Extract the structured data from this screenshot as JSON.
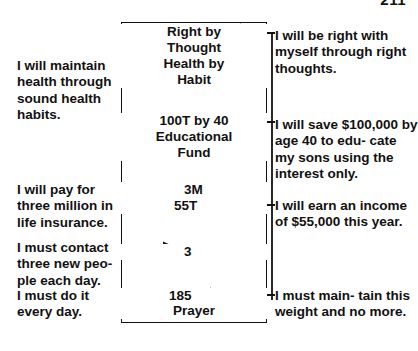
{
  "page": {
    "folio": "211"
  },
  "goal_box": {
    "items": [
      {
        "id": "right-by-thought",
        "lines": [
          "Right by",
          "Thought"
        ]
      },
      {
        "id": "health-by-habit",
        "lines": [
          "Health by",
          "Habit"
        ]
      },
      {
        "id": "educational-fund",
        "lines": [
          "100T by 40",
          "Educational",
          "Fund"
        ]
      },
      {
        "id": "three-million",
        "lines": [
          "3M"
        ]
      },
      {
        "id": "fifty-five-thousand",
        "lines": [
          "55T"
        ]
      },
      {
        "id": "three-people",
        "lines": [
          "3"
        ]
      },
      {
        "id": "one-eighty-five",
        "lines": [
          "185"
        ]
      },
      {
        "id": "prayer",
        "lines": [
          "Prayer"
        ]
      }
    ],
    "text": {
      "right_by": "Right by",
      "thought": "Thought",
      "health_by": "Health by",
      "habit": "Habit",
      "hundred_t_by_40": "100T by 40",
      "educational": "Educational",
      "fund": "Fund",
      "three_m": "3M",
      "fifty_five_t": "55T",
      "three": "3",
      "one_eight_five": "185",
      "prayer": "Prayer"
    }
  },
  "annotations": {
    "left": [
      {
        "id": "maintain-health",
        "text": "I will maintain health through sound health habits."
      },
      {
        "id": "life-insurance",
        "text": "I will pay for three million in life insurance."
      },
      {
        "id": "contact-people",
        "text": "I must contact three new peo- ple each day."
      },
      {
        "id": "prayer-daily",
        "text": "I must do it every day."
      }
    ],
    "right": [
      {
        "id": "right-thoughts",
        "text": "I will be right with myself through right thoughts."
      },
      {
        "id": "education-savings",
        "text": "I will save $100,000 by age 40 to edu- cate my sons using the interest only."
      },
      {
        "id": "income-goal",
        "text": "I will earn an income of $55,000 this year."
      },
      {
        "id": "weight-goal",
        "text": "I must main- tain this weight and no more."
      }
    ]
  },
  "colors": {
    "ink": "#111111",
    "paper": "#ffffff"
  }
}
